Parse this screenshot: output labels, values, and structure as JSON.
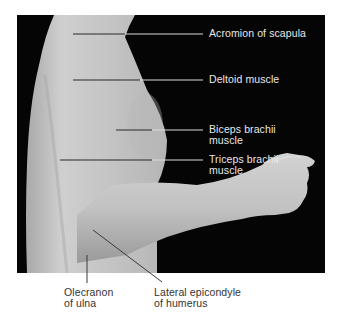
{
  "figure": {
    "background_color": "#050505",
    "skin_color": "#c9c9c9",
    "page_color": "#ffffff"
  },
  "labels": [
    {
      "id": "acromion",
      "line1": "Acromion of scapula",
      "line2": ""
    },
    {
      "id": "deltoid",
      "line1": "Deltoid muscle",
      "line2": ""
    },
    {
      "id": "biceps",
      "line1": "Biceps brachii",
      "line2": "muscle"
    },
    {
      "id": "triceps",
      "line1": "Triceps brachii",
      "line2": "muscle"
    },
    {
      "id": "olecranon",
      "line1": "Olecranon",
      "line2": "of ulna"
    },
    {
      "id": "lateral-epicondyle",
      "line1": "Lateral epicondyle",
      "line2": "of humerus"
    }
  ]
}
